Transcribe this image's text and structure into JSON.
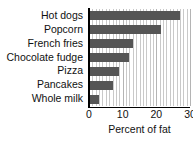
{
  "chart_data": {
    "type": "bar",
    "orientation": "horizontal",
    "title": "",
    "subtitle": "",
    "xlabel": "Percent of fat",
    "ylabel": "",
    "categories": [
      "Hot dogs",
      "Popcorn",
      "French fries",
      "Chocolate fudge",
      "Pizza",
      "Pancakes",
      "Whole milk"
    ],
    "values": [
      27,
      21.5,
      13,
      12,
      9,
      7,
      3
    ],
    "xlim": [
      0,
      30
    ],
    "xticks": [
      0,
      10,
      20,
      30
    ],
    "xtick_labels": [
      "0",
      "10",
      "20",
      "30"
    ],
    "grid": true,
    "grid_axis": "x",
    "grid_interval": 1,
    "legend": false,
    "bar_color": "#555555",
    "grid_color": "#c9c9c9",
    "axis_color": "#000000",
    "background_color": "#ffffff"
  },
  "axis": {
    "x_title": "Percent of fat"
  }
}
